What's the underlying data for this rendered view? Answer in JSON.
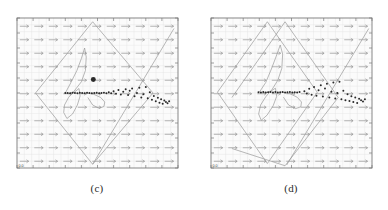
{
  "figure": {
    "kind": "two-panel phase portrait figure",
    "background_color": "#ffffff",
    "panels": [
      {
        "id": "c",
        "caption": "(c)"
      },
      {
        "id": "d",
        "caption": "(d)"
      }
    ]
  },
  "panel_c": {
    "caption": "(c)",
    "corner_label": "0.0",
    "frame_color": "#7a7a7a",
    "plot_background": "#fbfbfb",
    "grid_color": "#e2e2e2",
    "vector_color": "#8d8d8d",
    "trajectory_color": "#9a9a9a",
    "marker_color": "#2a2a2a"
  },
  "panel_d": {
    "caption": "(d)",
    "corner_label": "0.0",
    "frame_color": "#7a7a7a",
    "plot_background": "#fbfbfb",
    "grid_color": "#e2e2e2",
    "vector_color": "#8d8d8d",
    "trajectory_color": "#9a9a9a",
    "marker_color": "#2a2a2a"
  },
  "chart_data": [
    {
      "type": "scatter",
      "panel": "c",
      "title": "(c)",
      "xlabel": "",
      "ylabel": "",
      "xlim": [
        0,
        1
      ],
      "ylim": [
        0,
        1
      ],
      "grid": true,
      "legend": null,
      "annotations": [
        "0.0"
      ],
      "xticks": [
        0.0,
        0.1,
        0.2,
        0.3,
        0.4,
        0.5,
        0.6,
        0.7,
        0.8,
        0.9,
        1.0
      ],
      "yticks": [
        0.0,
        0.1,
        0.2,
        0.3,
        0.4,
        0.5,
        0.6,
        0.7,
        0.8,
        0.9,
        1.0
      ],
      "series": [
        {
          "name": "vector-field",
          "type": "quiver",
          "direction_deg": 0,
          "arrow_length": 0.055,
          "grid_nx": 11,
          "grid_ny": 11,
          "x": [
            0.045,
            0.135,
            0.225,
            0.315,
            0.405,
            0.495,
            0.585,
            0.675,
            0.765,
            0.855,
            0.945
          ],
          "y": [
            0.045,
            0.135,
            0.225,
            0.315,
            0.405,
            0.495,
            0.585,
            0.675,
            0.765,
            0.855,
            0.945
          ]
        },
        {
          "name": "outer-envelope-diamond",
          "type": "line",
          "closed": true,
          "x": [
            0.115,
            0.47,
            0.845,
            0.47,
            0.115
          ],
          "y": [
            0.5,
            0.975,
            0.5,
            0.025,
            0.5
          ]
        },
        {
          "name": "rising-diagonal",
          "type": "line",
          "closed": false,
          "x": [
            0.47,
            0.975
          ],
          "y": [
            0.025,
            0.93
          ]
        },
        {
          "name": "inner-spiral-bundle",
          "type": "line",
          "closed": false,
          "x": [
            0.3,
            0.33,
            0.372,
            0.4,
            0.42,
            0.43,
            0.425,
            0.4,
            0.36,
            0.32,
            0.295,
            0.29,
            0.31,
            0.345,
            0.375,
            0.392,
            0.385,
            0.355,
            0.322,
            0.305
          ],
          "y": [
            0.5,
            0.56,
            0.65,
            0.73,
            0.8,
            0.74,
            0.65,
            0.575,
            0.52,
            0.47,
            0.42,
            0.37,
            0.33,
            0.36,
            0.42,
            0.48,
            0.53,
            0.505,
            0.495,
            0.5
          ]
        },
        {
          "name": "loop-right-of-core",
          "type": "line",
          "closed": false,
          "x": [
            0.43,
            0.475,
            0.52,
            0.545,
            0.54,
            0.51,
            0.47,
            0.44
          ],
          "y": [
            0.5,
            0.492,
            0.47,
            0.44,
            0.41,
            0.398,
            0.42,
            0.47
          ]
        },
        {
          "name": "dense-core-bar",
          "type": "scatter",
          "marker": "point",
          "size": 1.6,
          "x": [
            0.3,
            0.315,
            0.33,
            0.345,
            0.36,
            0.375,
            0.39,
            0.405,
            0.42,
            0.435,
            0.45,
            0.465,
            0.48,
            0.495,
            0.51,
            0.525,
            0.54,
            0.555
          ],
          "y": [
            0.5,
            0.5,
            0.499,
            0.501,
            0.5,
            0.498,
            0.502,
            0.5,
            0.499,
            0.501,
            0.5,
            0.498,
            0.5,
            0.502,
            0.499,
            0.5,
            0.501,
            0.499
          ]
        },
        {
          "name": "scatter-tail",
          "type": "scatter",
          "marker": "point",
          "size": 1.6,
          "x": [
            0.57,
            0.585,
            0.6,
            0.615,
            0.63,
            0.645,
            0.66,
            0.675,
            0.69,
            0.7,
            0.715,
            0.73,
            0.745,
            0.76,
            0.772,
            0.785,
            0.8,
            0.812,
            0.825,
            0.838,
            0.85,
            0.862,
            0.875,
            0.885,
            0.895,
            0.905,
            0.915,
            0.925,
            0.935,
            0.945
          ],
          "y": [
            0.505,
            0.498,
            0.512,
            0.495,
            0.52,
            0.49,
            0.508,
            0.525,
            0.486,
            0.515,
            0.53,
            0.478,
            0.5,
            0.535,
            0.47,
            0.492,
            0.54,
            0.465,
            0.505,
            0.455,
            0.48,
            0.445,
            0.468,
            0.435,
            0.458,
            0.428,
            0.45,
            0.44,
            0.432,
            0.445
          ]
        },
        {
          "name": "highlight-dot",
          "type": "scatter",
          "marker": "filled-circle",
          "size": 4,
          "x": [
            0.474
          ],
          "y": [
            0.59
          ]
        }
      ]
    },
    {
      "type": "scatter",
      "panel": "d",
      "title": "(d)",
      "xlabel": "",
      "ylabel": "",
      "xlim": [
        0,
        1
      ],
      "ylim": [
        0,
        1
      ],
      "grid": true,
      "legend": null,
      "annotations": [
        "0.0"
      ],
      "xticks": [
        0.0,
        0.1,
        0.2,
        0.3,
        0.4,
        0.5,
        0.6,
        0.7,
        0.8,
        0.9,
        1.0
      ],
      "yticks": [
        0.0,
        0.1,
        0.2,
        0.3,
        0.4,
        0.5,
        0.6,
        0.7,
        0.8,
        0.9,
        1.0
      ],
      "series": [
        {
          "name": "vector-field",
          "type": "quiver",
          "direction_deg": 0,
          "arrow_length": 0.055,
          "grid_nx": 11,
          "grid_ny": 11,
          "x": [
            0.045,
            0.135,
            0.225,
            0.315,
            0.405,
            0.495,
            0.585,
            0.675,
            0.765,
            0.855,
            0.945
          ],
          "y": [
            0.045,
            0.135,
            0.225,
            0.315,
            0.405,
            0.495,
            0.585,
            0.675,
            0.765,
            0.855,
            0.945
          ]
        },
        {
          "name": "envelope-diamond-1",
          "type": "line",
          "closed": true,
          "x": [
            0.04,
            0.35,
            0.66,
            0.35,
            0.04
          ],
          "y": [
            0.505,
            0.975,
            0.505,
            0.03,
            0.505
          ]
        },
        {
          "name": "envelope-diamond-2",
          "type": "line",
          "closed": true,
          "x": [
            0.13,
            0.46,
            0.79,
            0.46,
            0.13
          ],
          "y": [
            0.47,
            0.975,
            0.47,
            0.015,
            0.13
          ]
        },
        {
          "name": "rising-diagonal",
          "type": "line",
          "closed": false,
          "x": [
            0.47,
            0.98
          ],
          "y": [
            0.02,
            0.93
          ]
        },
        {
          "name": "inner-spiral-bundle",
          "type": "line",
          "closed": false,
          "x": [
            0.3,
            0.34,
            0.375,
            0.405,
            0.43,
            0.445,
            0.44,
            0.415,
            0.38,
            0.34,
            0.308,
            0.296,
            0.312,
            0.348,
            0.386,
            0.408,
            0.4,
            0.368,
            0.33,
            0.306
          ],
          "y": [
            0.505,
            0.57,
            0.66,
            0.745,
            0.82,
            0.76,
            0.665,
            0.585,
            0.525,
            0.475,
            0.42,
            0.36,
            0.318,
            0.352,
            0.415,
            0.478,
            0.532,
            0.51,
            0.498,
            0.505
          ]
        },
        {
          "name": "loop-right-of-core",
          "type": "line",
          "closed": false,
          "x": [
            0.44,
            0.49,
            0.535,
            0.562,
            0.558,
            0.525,
            0.482,
            0.45
          ],
          "y": [
            0.505,
            0.496,
            0.472,
            0.44,
            0.408,
            0.396,
            0.42,
            0.472
          ]
        },
        {
          "name": "dense-core-bar",
          "type": "scatter",
          "marker": "point",
          "size": 1.6,
          "x": [
            0.295,
            0.31,
            0.325,
            0.34,
            0.355,
            0.37,
            0.385,
            0.4,
            0.415,
            0.43,
            0.445,
            0.46,
            0.475,
            0.49,
            0.505,
            0.52,
            0.535,
            0.55
          ],
          "y": [
            0.505,
            0.504,
            0.506,
            0.503,
            0.505,
            0.507,
            0.504,
            0.506,
            0.503,
            0.505,
            0.506,
            0.504,
            0.505,
            0.507,
            0.503,
            0.505,
            0.504,
            0.506
          ]
        },
        {
          "name": "scatter-tail",
          "type": "scatter",
          "marker": "point",
          "size": 1.6,
          "x": [
            0.58,
            0.595,
            0.61,
            0.625,
            0.64,
            0.655,
            0.668,
            0.682,
            0.695,
            0.708,
            0.72,
            0.735,
            0.748,
            0.76,
            0.772,
            0.785,
            0.798,
            0.81,
            0.822,
            0.835,
            0.848,
            0.86,
            0.872,
            0.884,
            0.896,
            0.908,
            0.92,
            0.932,
            0.944,
            0.956
          ],
          "y": [
            0.512,
            0.496,
            0.528,
            0.488,
            0.54,
            0.482,
            0.518,
            0.552,
            0.476,
            0.53,
            0.562,
            0.47,
            0.508,
            0.57,
            0.464,
            0.5,
            0.575,
            0.458,
            0.515,
            0.452,
            0.492,
            0.446,
            0.478,
            0.44,
            0.47,
            0.434,
            0.462,
            0.452,
            0.444,
            0.458
          ]
        }
      ]
    }
  ]
}
